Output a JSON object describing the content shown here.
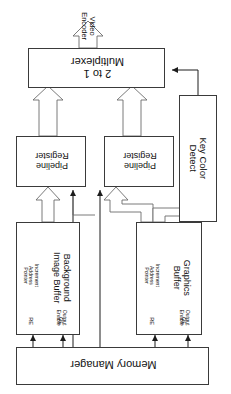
{
  "diagram": {
    "orientation": "rotated",
    "background_color": "#ffffff",
    "line_color": "#3a3a3a",
    "blocks": {
      "video_encoder": {
        "label": "Video\nEncoder",
        "rotation": "90cw",
        "is_box": false
      },
      "multiplexer": {
        "label": "2 to 1\nMultiplexer",
        "rotation": "180",
        "is_box": true
      },
      "pipeline_register_left": {
        "label": "Pipeline\nRegister",
        "rotation": "180",
        "is_box": true
      },
      "pipeline_register_right": {
        "label": "Pipeline\nRegister",
        "rotation": "180",
        "is_box": true
      },
      "key_color_detect": {
        "label": "Key Color\nDetect",
        "rotation": "90cw",
        "is_box": true
      },
      "background_image_buffer": {
        "label": "Background\nImage Buffer",
        "rotation": "90cw",
        "is_box": true,
        "pins": [
          {
            "name": "RE",
            "description": "Increment\nAddress\nPointer"
          },
          {
            "name": "OE",
            "description": "Output\nEnable"
          }
        ]
      },
      "graphics_buffer": {
        "label": "Graphics\nBuffer",
        "rotation": "90cw",
        "is_box": true,
        "pins": [
          {
            "name": "RE",
            "description": "Increment\nAddress\nPointer"
          },
          {
            "name": "OE",
            "description": "Output\nEnable"
          }
        ]
      },
      "memory_manager": {
        "label": "Memory Manager",
        "rotation": "180",
        "is_box": true
      }
    },
    "connections": [
      {
        "from": "multiplexer",
        "to": "video_encoder",
        "style": "block-arrow"
      },
      {
        "from": "pipeline_register_left",
        "to": "multiplexer",
        "style": "block-arrow"
      },
      {
        "from": "pipeline_register_right",
        "to": "multiplexer",
        "style": "block-arrow"
      },
      {
        "from": "key_color_detect",
        "to": "multiplexer",
        "style": "thin-arrow"
      },
      {
        "from": "background_image_buffer",
        "to": "pipeline_register_left",
        "style": "block-arrow"
      },
      {
        "from": "graphics_buffer",
        "to": "pipeline_register_right",
        "style": "block-arrow"
      },
      {
        "from": "graphics_buffer",
        "to": "key_color_detect",
        "style": "block-arrow"
      },
      {
        "from": "memory_manager",
        "to": "pipeline_register_left",
        "style": "thin-arrow"
      },
      {
        "from": "memory_manager",
        "to": "pipeline_register_right",
        "style": "thin-arrow"
      },
      {
        "from": "memory_manager",
        "to": "background_image_buffer.RE",
        "style": "thin-arrow"
      },
      {
        "from": "memory_manager",
        "to": "background_image_buffer.OE",
        "style": "thin-arrow"
      },
      {
        "from": "memory_manager",
        "to": "graphics_buffer.RE",
        "style": "thin-arrow"
      },
      {
        "from": "memory_manager",
        "to": "graphics_buffer.OE",
        "style": "thin-arrow"
      }
    ]
  }
}
